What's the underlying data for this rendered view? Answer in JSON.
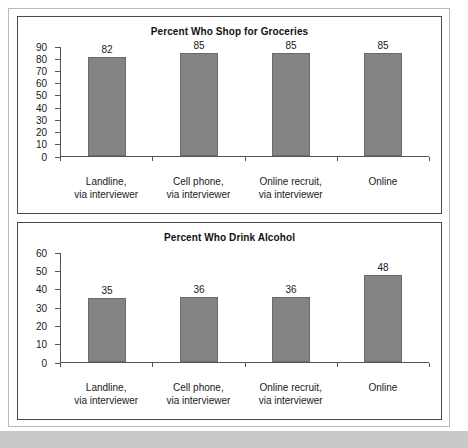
{
  "figure": {
    "background_color": "#ffffff",
    "frame_color": "#b9b9b9",
    "band_color": "#c9c9c9",
    "bar_color": "#848484",
    "bar_edge_color": "#6a6a6a",
    "axis_color": "#555555"
  },
  "chart_data": [
    {
      "type": "bar",
      "title": "Percent Who Shop for Groceries",
      "xlabel": "",
      "ylabel": "",
      "ylim": [
        0,
        90
      ],
      "yticks": [
        0,
        10,
        20,
        30,
        40,
        50,
        60,
        70,
        80,
        90
      ],
      "grid": false,
      "legend": null,
      "categories": [
        "Landline,\nvia interviewer",
        "Cell phone,\nvia interviewer",
        "Online recruit,\nvia interviewer",
        "Online"
      ],
      "category_lines": [
        [
          "Landline,",
          "via interviewer"
        ],
        [
          "Cell phone,",
          "via interviewer"
        ],
        [
          "Online recruit,",
          "via interviewer"
        ],
        [
          "Online",
          ""
        ]
      ],
      "values": [
        82,
        85,
        85,
        85
      ],
      "value_labels": [
        "82",
        "85",
        "85",
        "85"
      ]
    },
    {
      "type": "bar",
      "title": "Percent Who Drink Alcohol",
      "xlabel": "",
      "ylabel": "",
      "ylim": [
        0,
        60
      ],
      "yticks": [
        0,
        10,
        20,
        30,
        40,
        50,
        60
      ],
      "grid": false,
      "legend": null,
      "categories": [
        "Landline,\nvia interviewer",
        "Cell phone,\nvia interviewer",
        "Online recruit,\nvia interviewer",
        "Online"
      ],
      "category_lines": [
        [
          "Landline,",
          "via interviewer"
        ],
        [
          "Cell phone,",
          "via interviewer"
        ],
        [
          "Online recruit,",
          "via interviewer"
        ],
        [
          "Online",
          ""
        ]
      ],
      "values": [
        35,
        36,
        36,
        48
      ],
      "value_labels": [
        "35",
        "36",
        "36",
        "48"
      ]
    }
  ]
}
